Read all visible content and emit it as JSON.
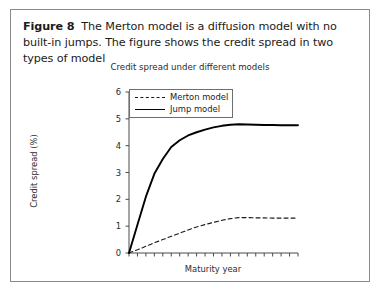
{
  "figure": {
    "caption_label": "Figure 8",
    "caption_text": "The Merton model is a diffusion model with no built-in jumps. The figure shows the credit spread in two types of model"
  },
  "chart_data": {
    "type": "line",
    "title": "Credit spread under different models",
    "xlabel": "Maturity year",
    "ylabel": "Credit spread (%)",
    "xlim": [
      0,
      20
    ],
    "ylim": [
      0,
      6
    ],
    "yticks": [
      0,
      1,
      2,
      3,
      4,
      5,
      6
    ],
    "ytick_labels": [
      "0",
      "1",
      "2",
      "3",
      "4",
      "5",
      "6"
    ],
    "xticks": [
      0,
      1,
      2,
      3,
      4,
      5,
      6,
      7,
      8,
      9,
      10,
      11,
      12,
      13,
      14,
      15,
      16,
      17,
      18,
      19,
      20
    ],
    "xtick_labels": [],
    "grid": false,
    "legend_position": "top-left",
    "x": [
      0,
      1,
      2,
      3,
      4,
      5,
      6,
      7,
      8,
      9,
      10,
      11,
      12,
      13,
      14,
      15,
      16,
      17,
      18,
      19,
      20
    ],
    "series": [
      {
        "name": "Merton model",
        "style": "dashed",
        "color": "#1a1a1a",
        "values": [
          0.0,
          0.12,
          0.25,
          0.38,
          0.5,
          0.62,
          0.74,
          0.86,
          0.97,
          1.06,
          1.14,
          1.22,
          1.28,
          1.32,
          1.32,
          1.31,
          1.31,
          1.3,
          1.3,
          1.3,
          1.3
        ]
      },
      {
        "name": "Jump model",
        "style": "solid",
        "color": "#000000",
        "values": [
          0.0,
          1.05,
          2.1,
          2.95,
          3.5,
          3.95,
          4.2,
          4.38,
          4.5,
          4.6,
          4.68,
          4.74,
          4.78,
          4.8,
          4.79,
          4.78,
          4.77,
          4.77,
          4.76,
          4.76,
          4.76
        ]
      }
    ]
  },
  "colors": {
    "border": "#8b8b8b",
    "axis": "#4a4a4a",
    "text": "#1a1a1a"
  }
}
